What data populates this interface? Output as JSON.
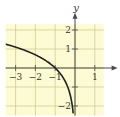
{
  "chart_data": {
    "type": "line",
    "title": "",
    "function": "y = ln(-x)",
    "xlabel": "x",
    "ylabel": "y",
    "xlim": [
      -3.5,
      1.5
    ],
    "ylim": [
      -2.5,
      2.5
    ],
    "grid": true,
    "x_ticks": [
      {
        "value": -3,
        "label": "−3"
      },
      {
        "value": -2,
        "label": "−2"
      },
      {
        "value": -1,
        "label": "−1"
      },
      {
        "value": 1,
        "label": "1"
      }
    ],
    "y_ticks": [
      {
        "value": 2,
        "label": "2"
      },
      {
        "value": 1,
        "label": "1"
      },
      {
        "value": -2,
        "label": "−2"
      }
    ],
    "series": [
      {
        "name": "ln(-x)",
        "x": [
          -3.5,
          -3,
          -2.5,
          -2,
          -1.5,
          -1,
          -0.75,
          -0.5,
          -0.35,
          -0.25,
          -0.15,
          -0.1
        ],
        "y": [
          1.25,
          1.1,
          0.92,
          0.69,
          0.41,
          0.0,
          -0.29,
          -0.69,
          -1.05,
          -1.39,
          -1.9,
          -2.3
        ]
      }
    ],
    "colors": {
      "background": "#fdfbd4",
      "grid": "#c9c78a",
      "axis": "#4a4a4a",
      "curve": "#222222"
    }
  }
}
